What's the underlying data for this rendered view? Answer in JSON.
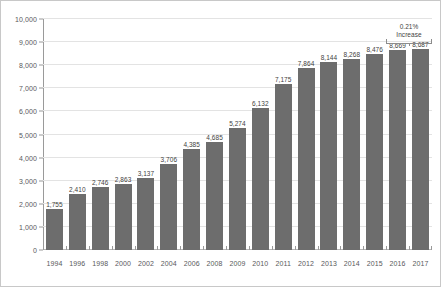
{
  "chart_data": {
    "type": "bar",
    "title": "",
    "xlabel": "",
    "ylabel": "",
    "ylim": [
      0,
      10000
    ],
    "grid": true,
    "legend": "none",
    "categories": [
      "1994",
      "1996",
      "1998",
      "2000",
      "2002",
      "2004",
      "2006",
      "2008",
      "2009",
      "2010",
      "2011",
      "2012",
      "2013",
      "2014",
      "2015",
      "2016",
      "2017"
    ],
    "values": [
      1755,
      2410,
      2746,
      2863,
      3137,
      3706,
      4385,
      4685,
      5274,
      6132,
      7175,
      7864,
      8144,
      8268,
      8476,
      8669,
      8687
    ],
    "value_labels": [
      "1,755",
      "2,410",
      "2,746",
      "2,863",
      "3,137",
      "3,706",
      "4,385",
      "4,685",
      "5,274",
      "6,132",
      "7,175",
      "7,864",
      "8,144",
      "8,268",
      "8,476",
      "8,669",
      "8,687"
    ],
    "y_ticks": [
      0,
      1000,
      2000,
      3000,
      4000,
      5000,
      6000,
      7000,
      8000,
      9000,
      10000
    ],
    "y_tick_labels": [
      "0",
      "1,000",
      "2,000",
      "3,000",
      "4,000",
      "5,000",
      "6,000",
      "7,000",
      "8,000",
      "9,000",
      "10,000"
    ],
    "annotations": [
      {
        "line1": "0.21%",
        "line2": "Increase",
        "from_category": "2016",
        "to_category": "2017"
      }
    ],
    "colors": {
      "bar": "#6d6d6d",
      "grid": "#e3e3e3",
      "axis": "#9a9a9a",
      "label_text": "#59595b",
      "value_text": "#3f3f41",
      "background": "#ffffff",
      "frame": "#c8c8c8"
    }
  }
}
